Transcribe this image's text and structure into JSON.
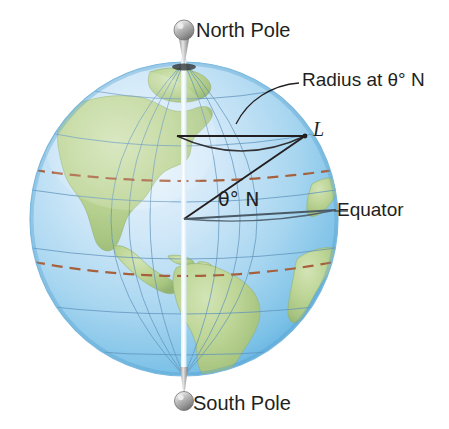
{
  "figure": {
    "type": "globe-diagram",
    "background_color": "#ffffff"
  },
  "labels": {
    "north_pole": "North Pole",
    "south_pole": "South Pole",
    "radius_at_theta": "Radius at θ° N",
    "point_l": "L",
    "angle": "θ° N",
    "equator": "Equator"
  },
  "colors": {
    "ocean_light": "#cfe6f7",
    "ocean_mid": "#9fd0ee",
    "ocean_deep": "#63b4e2",
    "land_green": "#b3cf8e",
    "land_edge": "#8fae6b",
    "graticule": "#5f93bb",
    "tropic_dashed": "#a8603c",
    "construction_line": "#231f20",
    "equator_line": "#4a5a66",
    "pin_gray": "#9a9a9a",
    "text": "#231f20",
    "axis_white": "#ffffff"
  },
  "geometry": {
    "globe_center_x": 184,
    "globe_center_y": 219,
    "globe_radius_x": 154,
    "globe_radius_y": 157,
    "center_point": [
      184,
      219
    ],
    "point_l": [
      305,
      136
    ],
    "radius_line_start": [
      177,
      136
    ],
    "radius_line_end": [
      305,
      136
    ],
    "equator_line_start": [
      184,
      219
    ],
    "equator_line_end": [
      336,
      210
    ],
    "tropic_cancer_y": 158,
    "tropic_capricorn_y": 263
  },
  "elements": {
    "north_pole_pin": "pin-icon",
    "south_pole_pin": "pin-icon",
    "axis": "rotation-axis",
    "leader_line": "callout-leader"
  }
}
